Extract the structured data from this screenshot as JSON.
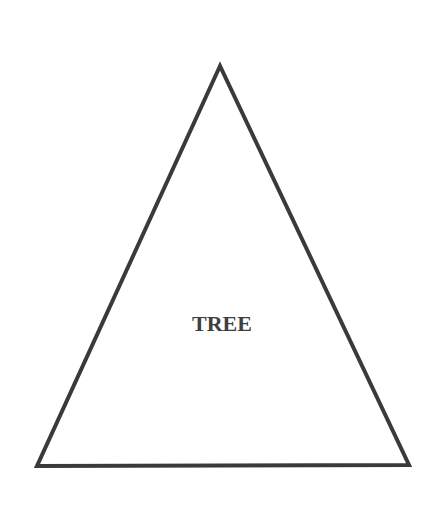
{
  "diagram": {
    "shape": "triangle",
    "label": "TREE",
    "colors": {
      "background": "#ffffff",
      "stroke": "#3a3a3a",
      "text": "#3f3f3f"
    },
    "stroke_width": 4,
    "vertices": {
      "apex": [
        220,
        66
      ],
      "bottom_left": [
        37,
        466
      ],
      "bottom_right": [
        409,
        465
      ]
    },
    "label_position": [
      222,
      331
    ]
  }
}
